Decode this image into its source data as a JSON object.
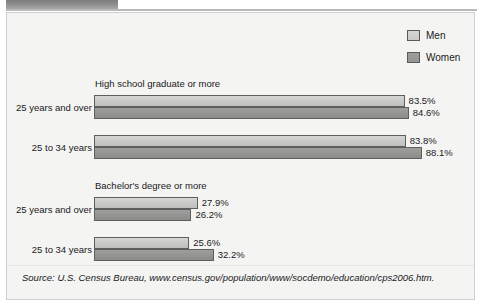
{
  "figure": {
    "background_color": "#f4f4f3",
    "border_color": "#cfcfcf",
    "header_band_color": "#8c8c8c"
  },
  "legend": {
    "position": "top-right",
    "items": [
      {
        "label": "Men",
        "color": "#c8c8c6",
        "swatch_name": "legend-swatch-men"
      },
      {
        "label": "Women",
        "color": "#949492",
        "swatch_name": "legend-swatch-women"
      }
    ]
  },
  "source": {
    "text": "Source: U.S. Census Bureau, www.census.gov/population/www/socdemo/education/cps2006.htm."
  },
  "chart_data": {
    "type": "bar",
    "orientation": "horizontal",
    "title": "",
    "xlabel": "",
    "ylabel": "",
    "xlim": [
      0,
      100
    ],
    "grid": false,
    "legend_position": "top-right",
    "value_suffix": "%",
    "series": [
      {
        "name": "Men",
        "color": "#c8c8c6"
      },
      {
        "name": "Women",
        "color": "#949492"
      }
    ],
    "groups": [
      {
        "title": "High school graduate or more",
        "categories": [
          "25 years and over",
          "25 to 34 years"
        ],
        "values": {
          "Men": [
            83.5,
            83.8
          ],
          "Women": [
            84.6,
            88.1
          ]
        },
        "labels": {
          "Men": [
            "83.5%",
            "83.8%"
          ],
          "Women": [
            "84.6%",
            "88.1%"
          ]
        }
      },
      {
        "title": "Bachelor's degree or more",
        "categories": [
          "25 years and over",
          "25 to 34 years"
        ],
        "values": {
          "Men": [
            27.9,
            25.6
          ],
          "Women": [
            26.2,
            32.2
          ]
        },
        "labels": {
          "Men": [
            "27.9%",
            "25.6%"
          ],
          "Women": [
            "26.2%",
            "32.2%"
          ]
        }
      }
    ]
  }
}
